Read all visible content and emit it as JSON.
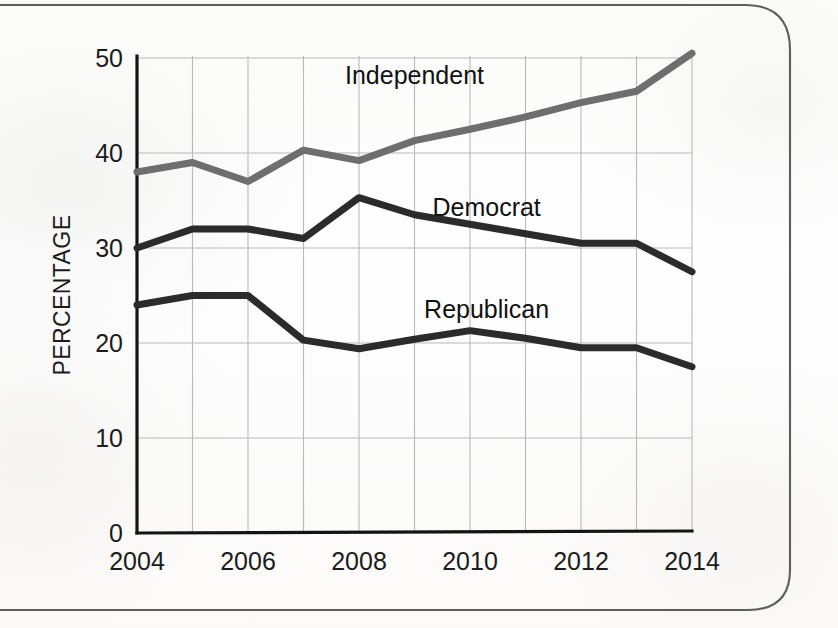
{
  "chart_data": {
    "type": "line",
    "title": "",
    "subtitle": "",
    "xlabel": "",
    "ylabel": "PERCENTAGE",
    "x": [
      2004,
      2005,
      2006,
      2007,
      2008,
      2009,
      2010,
      2011,
      2012,
      2013,
      2014
    ],
    "xtick_labels": [
      "2004",
      "2006",
      "2008",
      "2010",
      "2012",
      "2014"
    ],
    "xtick_values": [
      2004,
      2006,
      2008,
      2010,
      2012,
      2014
    ],
    "ytick_labels": [
      "0",
      "10",
      "20",
      "30",
      "40",
      "50"
    ],
    "ytick_values": [
      0,
      10,
      20,
      30,
      40,
      50
    ],
    "xlim": [
      2004,
      2014
    ],
    "ylim": [
      0,
      50
    ],
    "grid": true,
    "legend_position": "inline-annotations",
    "series": [
      {
        "name": "Independent",
        "color": "#6e6e6e",
        "stroke_width": 7,
        "values": [
          38.0,
          39.0,
          37.0,
          40.3,
          39.2,
          41.3,
          42.5,
          43.8,
          45.3,
          46.5,
          50.5
        ],
        "label": "Independent",
        "label_x": 2009.0,
        "label_y": 47.3
      },
      {
        "name": "Democrat",
        "color": "#2b2b2b",
        "stroke_width": 7,
        "values": [
          30.0,
          32.0,
          32.0,
          31.0,
          35.3,
          33.5,
          32.5,
          31.5,
          30.5,
          30.5,
          27.5
        ],
        "label": "Democrat",
        "label_x": 2010.3,
        "label_y": 33.4
      },
      {
        "name": "Republican",
        "color": "#2b2b2b",
        "stroke_width": 7,
        "values": [
          24.0,
          25.0,
          25.0,
          20.3,
          19.4,
          20.4,
          21.3,
          20.5,
          19.5,
          19.5,
          17.5
        ],
        "label": "Republican",
        "label_x": 2010.3,
        "label_y": 22.6
      }
    ]
  }
}
